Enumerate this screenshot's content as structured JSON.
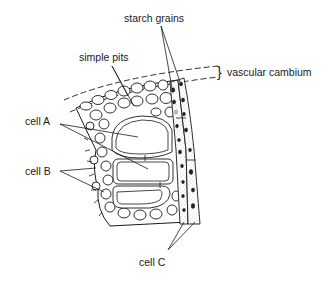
{
  "diagram": {
    "type": "botanical-cross-section",
    "labels": {
      "starch_grains": "starch grains",
      "simple_pits": "simple pits",
      "vascular_cambium": "vascular cambium",
      "cell_a": "cell A",
      "cell_b": "cell B",
      "cell_c": "cell C"
    },
    "brace_symbol": "}",
    "colors": {
      "ink": "#1a1a1a",
      "background": "#ffffff",
      "stipple": "#bdbdbd"
    }
  }
}
